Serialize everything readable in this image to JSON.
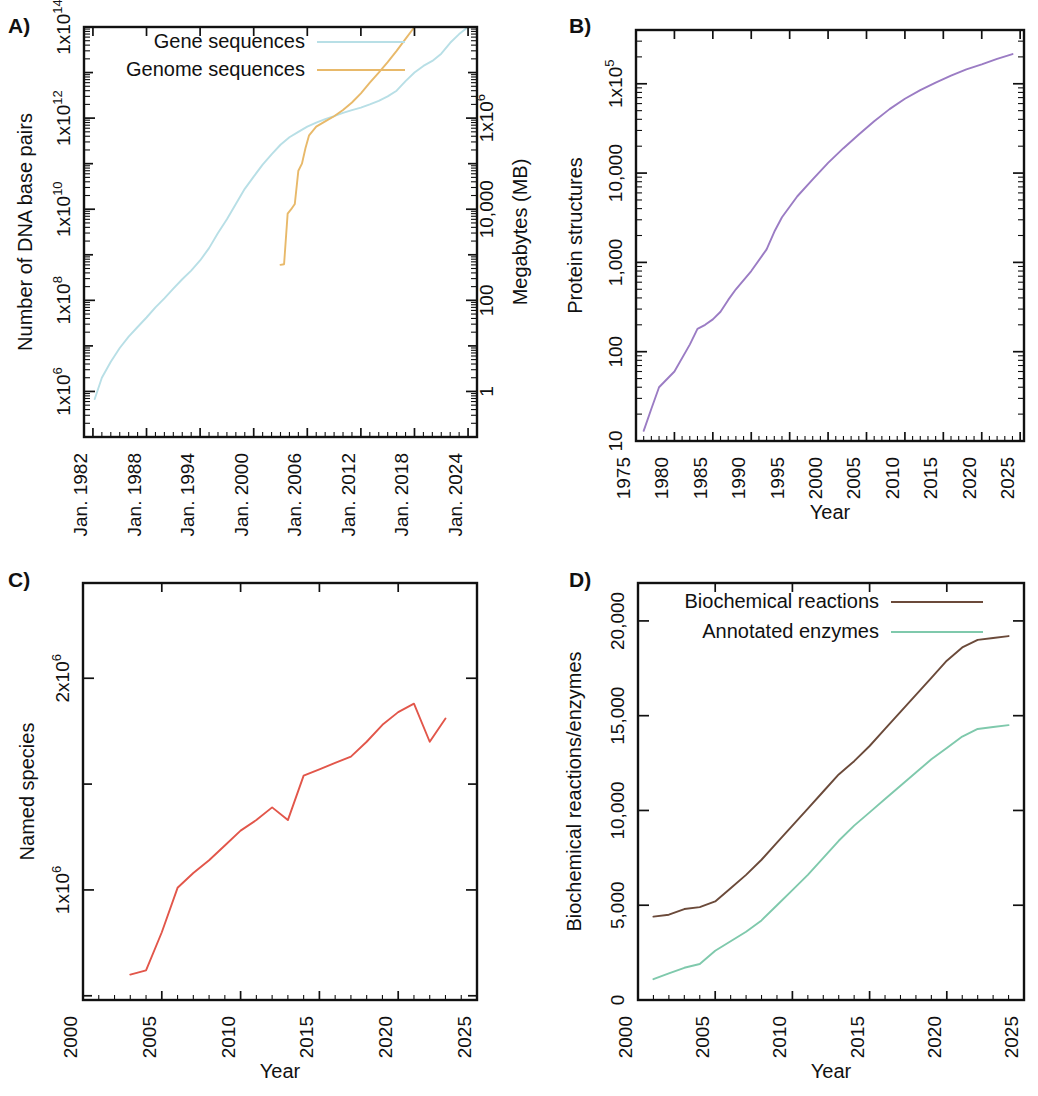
{
  "figure": {
    "panels": [
      "A)",
      "B)",
      "C)",
      "D)"
    ]
  },
  "chart_data": [
    {
      "panel": "A)",
      "type": "line",
      "title": "",
      "xlabel": "",
      "ylabel": "Number of DNA base pairs",
      "y2label": "Megabytes (MB)",
      "xlim": [
        1981.0,
        2025.0
      ],
      "ylim": [
        100000.0,
        100000000000000.0
      ],
      "yscale": "log",
      "xscale": "linear",
      "grid": false,
      "legend_position": "top-center",
      "xticks": [
        1982,
        1988,
        1994,
        2000,
        2006,
        2012,
        2018,
        2024
      ],
      "xticklabels": [
        "Jan. 1982",
        "Jan. 1988",
        "Jan. 1994",
        "Jan. 2000",
        "Jan. 2006",
        "Jan. 2012",
        "Jan. 2018",
        "Jan. 2024"
      ],
      "yticks": [
        1000000.0,
        100000000.0,
        10000000000.0,
        1000000000000.0,
        100000000000000.0
      ],
      "yticklabels": [
        "1x10^6",
        "1x10^8",
        "1x10^10",
        "1x10^12",
        "1x10^14"
      ],
      "y2ticks": [
        1,
        100,
        10000,
        1000000
      ],
      "y2ticklabels": [
        "1",
        "100",
        "10,000",
        "1x10^6"
      ],
      "series": [
        {
          "name": "Gene sequences",
          "color": "#b8dfe6",
          "x": [
            1982.2,
            1983.0,
            1984.0,
            1985.0,
            1986.0,
            1987.0,
            1988.0,
            1989.0,
            1990.0,
            1991.0,
            1992.0,
            1993.0,
            1994.0,
            1995.0,
            1996.0,
            1997.0,
            1998.0,
            1999.0,
            2000.0,
            2001.0,
            2002.0,
            2003.0,
            2004.0,
            2005.0,
            2006.0,
            2007.0,
            2008.0,
            2009.0,
            2010.0,
            2011.0,
            2012.0,
            2013.0,
            2014.0,
            2015.0,
            2016.0,
            2017.0,
            2018.0,
            2019.0,
            2020.0,
            2021.0,
            2022.0,
            2023.0,
            2024.0
          ],
          "y": [
            680000,
            2000000,
            4500000,
            9000000,
            16000000.0,
            26000000.0,
            42000000.0,
            70000000.0,
            110000000.0,
            180000000.0,
            290000000.0,
            450000000.0,
            750000000.0,
            1400000000.0,
            3000000000.0,
            6000000000.0,
            13000000000.0,
            28000000000.0,
            52000000000.0,
            95000000000.0,
            160000000000.0,
            260000000000.0,
            380000000000.0,
            500000000000.0,
            650000000000.0,
            800000000000.0,
            950000000000.0,
            1100000000000.0,
            1300000000000.0,
            1500000000000.0,
            1700000000000.0,
            2000000000000.0,
            2400000000000.0,
            3000000000000.0,
            4000000000000.0,
            6500000000000.0,
            10000000000000.0,
            14000000000000.0,
            18000000000000.0,
            26000000000000.0,
            45000000000000.0,
            70000000000000.0,
            100000000000000.0
          ]
        },
        {
          "name": "Genome sequences",
          "color": "#e8b96a",
          "x": [
            2003.0,
            2003.4,
            2003.8,
            2004.2,
            2004.6,
            2005.0,
            2005.4,
            2005.8,
            2006.2,
            2007.0,
            2008.0,
            2009.0,
            2010.0,
            2011.0,
            2012.0,
            2013.0,
            2014.0,
            2015.0,
            2016.0,
            2017.0,
            2018.0,
            2019.0,
            2020.0,
            2021.0,
            2022.0,
            2023.0,
            2024.0
          ],
          "y": [
            600000000.0,
            620000000.0,
            8000000000.0,
            10000000000.0,
            13000000000.0,
            70000000000.0,
            100000000000.0,
            220000000000.0,
            420000000000.0,
            650000000000.0,
            850000000000.0,
            1100000000000.0,
            1500000000000.0,
            2200000000000.0,
            3500000000000.0,
            6000000000000.0,
            10000000000000.0,
            17000000000000.0,
            30000000000000.0,
            55000000000000.0,
            100000000000000.0,
            180000000000000.0,
            300000000000000.0,
            550000000000000.0,
            1100000000000000.0,
            2400000000000000.0,
            3000000000000000.0
          ]
        }
      ]
    },
    {
      "panel": "B)",
      "type": "line",
      "title": "",
      "xlabel": "Year",
      "ylabel": "Protein structures",
      "xlim": [
        1975.0,
        2025.5
      ],
      "ylim": [
        10,
        400000
      ],
      "yscale": "log",
      "xscale": "linear",
      "grid": false,
      "legend_position": "none",
      "xticks": [
        1975,
        1980,
        1985,
        1990,
        1995,
        2000,
        2005,
        2010,
        2015,
        2020,
        2025
      ],
      "xticklabels": [
        "1975",
        "1980",
        "1985",
        "1990",
        "1995",
        "2000",
        "2005",
        "2010",
        "2015",
        "2020",
        "2025"
      ],
      "yticks": [
        10,
        100,
        1000,
        10000,
        100000
      ],
      "yticklabels": [
        "10",
        "100",
        "1,000",
        "10,000",
        "1x10^5"
      ],
      "series": [
        {
          "name": "Protein structures",
          "color": "#9b7cc4",
          "x": [
            1976.0,
            1977.0,
            1978.0,
            1980.0,
            1982.0,
            1983.0,
            1984.0,
            1985.0,
            1986.0,
            1987.0,
            1988.0,
            1990.0,
            1992.0,
            1993.0,
            1994.0,
            1995.0,
            1996.0,
            1998.0,
            2000.0,
            2002.0,
            2004.0,
            2006.0,
            2008.0,
            2010.0,
            2012.0,
            2014.0,
            2016.0,
            2018.0,
            2020.0,
            2022.0,
            2024.0
          ],
          "y": [
            13,
            23,
            40,
            60,
            120,
            180,
            200,
            230,
            280,
            380,
            500,
            800,
            1400,
            2200,
            3200,
            4200,
            5500,
            8500,
            13000,
            19000,
            27000,
            38000,
            52000,
            68000,
            85000,
            103000,
            123000,
            145000,
            165000,
            190000,
            215000
          ]
        }
      ]
    },
    {
      "panel": "C)",
      "type": "line",
      "title": "",
      "xlabel": "Year",
      "ylabel": "Named species",
      "xlim": [
        2000.0,
        2025.0
      ],
      "ylim": [
        480000,
        2450000
      ],
      "yscale": "linear",
      "xscale": "linear",
      "grid": false,
      "legend_position": "none",
      "xticks": [
        2000,
        2005,
        2010,
        2015,
        2020,
        2025
      ],
      "xticklabels": [
        "2000",
        "2005",
        "2010",
        "2015",
        "2020",
        "2025"
      ],
      "yticks": [
        1000000,
        2000000
      ],
      "yticklabels": [
        "1x10^6",
        "2x10^6"
      ],
      "yticks_minor": [
        1500000,
        500000
      ],
      "series": [
        {
          "name": "Named species",
          "color": "#e2564a",
          "x": [
            2003.0,
            2004.0,
            2005.0,
            2006.0,
            2007.0,
            2008.0,
            2009.0,
            2010.0,
            2011.0,
            2012.0,
            2013.0,
            2014.0,
            2015.0,
            2016.0,
            2017.0,
            2018.0,
            2019.0,
            2020.0,
            2021.0,
            2022.0,
            2023.0
          ],
          "y": [
            600000,
            620000,
            800000,
            1010000,
            1080000,
            1140000,
            1210000,
            1280000,
            1330000,
            1390000,
            1330000,
            1540000,
            1570000,
            1600000,
            1630000,
            1700000,
            1780000,
            1840000,
            1880000,
            1700000,
            1810000
          ]
        }
      ]
    },
    {
      "panel": "D)",
      "type": "line",
      "title": "",
      "xlabel": "Year",
      "ylabel": "Biochemical reactions/enzymes",
      "xlim": [
        2000.0,
        2025.0
      ],
      "ylim": [
        0,
        22000
      ],
      "yscale": "linear",
      "xscale": "linear",
      "grid": false,
      "legend_position": "top-center",
      "xticks": [
        2000,
        2005,
        2010,
        2015,
        2020,
        2025
      ],
      "xticklabels": [
        "2000",
        "2005",
        "2010",
        "2015",
        "2020",
        "2025"
      ],
      "yticks": [
        0,
        5000,
        10000,
        15000,
        20000
      ],
      "yticklabels": [
        "0",
        "5,000",
        "10,000",
        "15,000",
        "20,000"
      ],
      "series": [
        {
          "name": "Biochemical reactions",
          "color": "#6b4a3a",
          "x": [
            2001.0,
            2002.0,
            2003.0,
            2004.0,
            2005.0,
            2006.0,
            2007.0,
            2008.0,
            2009.0,
            2010.0,
            2011.0,
            2012.0,
            2013.0,
            2014.0,
            2015.0,
            2016.0,
            2017.0,
            2018.0,
            2019.0,
            2020.0,
            2021.0,
            2022.0,
            2023.0,
            2024.0
          ],
          "y": [
            4400,
            4500,
            4800,
            4900,
            5200,
            5900,
            6600,
            7400,
            8300,
            9200,
            10100,
            11000,
            11900,
            12600,
            13400,
            14300,
            15200,
            16100,
            17000,
            17900,
            18600,
            19000,
            19100,
            19200
          ]
        },
        {
          "name": "Annotated enzymes",
          "color": "#7fc9ac",
          "x": [
            2001.0,
            2002.0,
            2003.0,
            2004.0,
            2005.0,
            2006.0,
            2007.0,
            2008.0,
            2009.0,
            2010.0,
            2011.0,
            2012.0,
            2013.0,
            2014.0,
            2015.0,
            2016.0,
            2017.0,
            2018.0,
            2019.0,
            2020.0,
            2021.0,
            2022.0,
            2023.0,
            2024.0
          ],
          "y": [
            1100,
            1400,
            1700,
            1900,
            2600,
            3100,
            3600,
            4200,
            5000,
            5800,
            6600,
            7500,
            8400,
            9200,
            9900,
            10600,
            11300,
            12000,
            12700,
            13300,
            13900,
            14300,
            14400,
            14500
          ]
        }
      ]
    }
  ]
}
